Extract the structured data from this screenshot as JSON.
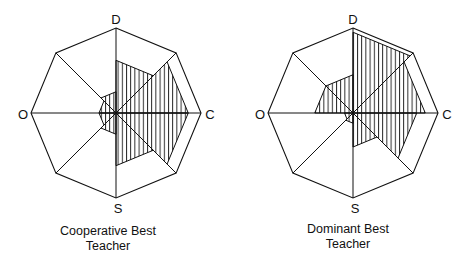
{
  "diagrams": [
    {
      "id": "cooperative",
      "caption_line1": "Cooperative Best",
      "caption_line2": "Teacher",
      "center": [
        116,
        113
      ],
      "radius": 85,
      "labels": {
        "top": "D",
        "right": "C",
        "bottom": "S",
        "left": "O"
      },
      "octant_values": [
        0.62,
        0.85,
        0.85,
        0.62,
        0.25,
        0.2,
        0.2,
        0.25
      ]
    },
    {
      "id": "dominant",
      "caption_line1": "Dominant Best",
      "caption_line2": "Teacher",
      "center": [
        353,
        113
      ],
      "radius": 85,
      "labels": {
        "top": "D",
        "right": "C",
        "bottom": "S",
        "left": "O"
      },
      "octant_values": [
        0.95,
        0.85,
        0.75,
        0.4,
        0.12,
        0.1,
        0.45,
        0.45
      ]
    }
  ],
  "octant_order": [
    "D-DC",
    "DC-C",
    "C-CS",
    "CS-S",
    "S-SO",
    "SO-O",
    "O-OD",
    "OD-D"
  ],
  "colors": {
    "stroke": "#111111",
    "hatch": "#111111",
    "background": "#ffffff"
  }
}
